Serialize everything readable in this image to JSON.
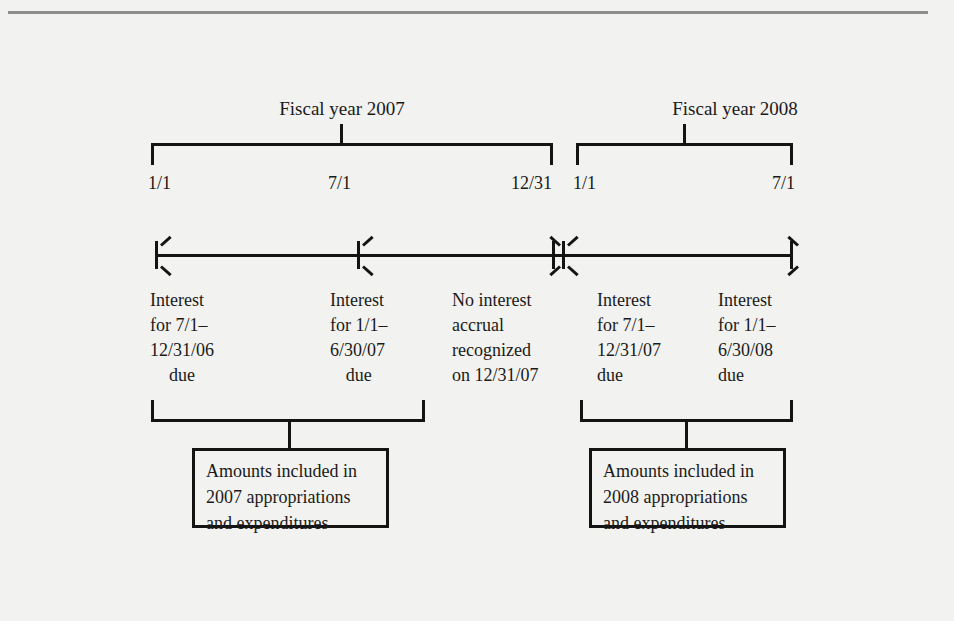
{
  "figure": {
    "kind": "accounting-timeline-diagram",
    "ink_color": "#141414",
    "paper_color": "#f2f2f0",
    "rule_color": "#8e8e8e"
  },
  "fiscal_years": [
    {
      "label": "Fiscal year 2007"
    },
    {
      "label": "Fiscal year 2008"
    }
  ],
  "date_marks": [
    {
      "label": "1/1"
    },
    {
      "label": "7/1"
    },
    {
      "label": "12/31"
    },
    {
      "label": "1/1"
    },
    {
      "label": "7/1"
    }
  ],
  "notes": [
    {
      "line1": "Interest",
      "line2": "for 7/1–",
      "line3": "12/31/06",
      "line4": "due"
    },
    {
      "line1": "Interest",
      "line2": "for 1/1–",
      "line3": "6/30/07",
      "line4": "due"
    },
    {
      "line1": "No interest",
      "line2": "accrual",
      "line3": "recognized",
      "line4": "on 12/31/07"
    },
    {
      "line1": "Interest",
      "line2": "for 7/1–",
      "line3": "12/31/07",
      "line4": "due"
    },
    {
      "line1": "Interest",
      "line2": "for 1/1–",
      "line3": "6/30/08",
      "line4": "due"
    }
  ],
  "callouts": [
    {
      "line1": "Amounts included in",
      "line2": "2007 appropriations",
      "line3": "and expenditures"
    },
    {
      "line1": "Amounts included in",
      "line2": "2008 appropriations",
      "line3": "and expenditures"
    }
  ]
}
